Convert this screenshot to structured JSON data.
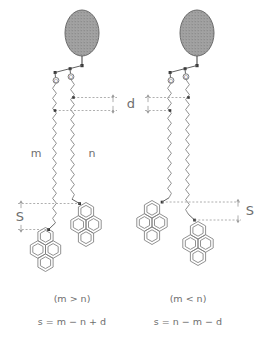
{
  "figure": {
    "background": "#ffffff",
    "stroke_color": "#7d7d7d",
    "dash_color": "#9b9b9b",
    "text_color": "#6e6e6e",
    "headgroup_fill": "#9a9a9a",
    "headgroup_stroke": "#6b6b6b",
    "node_fill": "#3a3a3a"
  },
  "labels": {
    "chain_m": "m",
    "chain_n": "n",
    "distance_d": "d",
    "offset_s_left": "S",
    "offset_s_right": "S",
    "oxygen_left_outer": "O",
    "oxygen_left_inner": "O",
    "oxygen_right_outer": "O",
    "oxygen_right_inner": "O"
  },
  "molecules": [
    {
      "id": "left",
      "condition": "(m > n)",
      "equation": "s = m − n + d",
      "headgroup": "stippled-ellipse",
      "terminal_groups": [
        "pyrene",
        "pyrene"
      ],
      "chains": [
        "m",
        "n"
      ]
    },
    {
      "id": "right",
      "condition": "(m < n)",
      "equation": "s = n − m − d",
      "headgroup": "stippled-ellipse",
      "terminal_groups": [
        "pyrene",
        "pyrene"
      ],
      "chains": [
        "m",
        "n"
      ]
    }
  ],
  "captions": {
    "left_condition": "(m > n)",
    "left_equation": "s = m − n + d",
    "right_condition": "(m < n)",
    "right_equation": "s = n − m − d"
  },
  "annotations": {
    "d_description": "vertical offset between the two ester linkage points",
    "s_description": "vertical offset between the two pyrene attachment points"
  }
}
